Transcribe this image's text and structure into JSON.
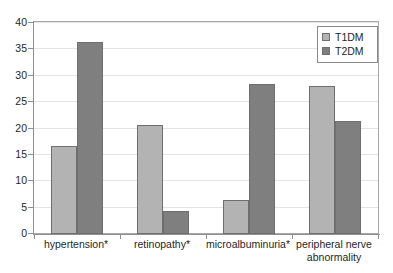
{
  "chart_data": {
    "type": "bar",
    "title": "",
    "subtitle": "",
    "xlabel": "",
    "ylabel": "",
    "ylim": [
      0,
      40
    ],
    "yticks": [
      0,
      5,
      10,
      15,
      20,
      25,
      30,
      35,
      40
    ],
    "ytick_labels": [
      "0",
      "5",
      "10",
      "15",
      "20",
      "25",
      "30",
      "35",
      "40"
    ],
    "grid": true,
    "grid_axis": "y",
    "legend_position": "top-right",
    "categories": [
      "hypertension*",
      "retinopathy*",
      "microalbuminuria*",
      "peripheral nerve abnormality"
    ],
    "series": [
      {
        "name": "T1DM",
        "color": "#b3b3b3",
        "values": [
          16.6,
          20.6,
          6.5,
          28.1
        ]
      },
      {
        "name": "T2DM",
        "color": "#7f7f7f",
        "values": [
          36.4,
          4.4,
          28.5,
          21.5
        ]
      }
    ],
    "annotations": []
  },
  "legend": {
    "entries": [
      {
        "label": "T1DM",
        "swatch": "legend-swatch-t1dm"
      },
      {
        "label": "T2DM",
        "swatch": "legend-swatch-t2dm"
      }
    ]
  },
  "colors": {
    "series1": "#b3b3b3",
    "series2": "#7f7f7f",
    "bar_border": "#6e6e6e",
    "axis": "#8f8f8f",
    "gridline": "#e3e3e3",
    "plot_border": "#a8a8a8",
    "text": "#1f1f1f",
    "background": "#ffffff"
  }
}
